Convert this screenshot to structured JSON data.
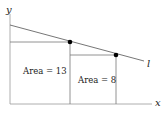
{
  "axes": {
    "x_label": "x",
    "y_label": "y"
  },
  "line": {
    "label": "l"
  },
  "rectangles": [
    {
      "label": "Area = 13"
    },
    {
      "label": "Area = 8"
    }
  ],
  "colors": {
    "axis": "#888888",
    "line": "#666666",
    "point": "#000000",
    "text": "#222222"
  }
}
